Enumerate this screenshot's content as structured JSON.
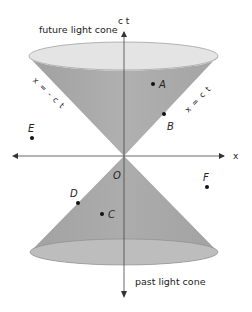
{
  "diagram": {
    "labels": {
      "future_cone": "future light cone",
      "past_cone": "past light cone",
      "time_axis": "c t",
      "space_axis": "x",
      "origin": "O",
      "line_right": "x = c t",
      "line_left": "x = - c t"
    },
    "points": [
      {
        "id": "A",
        "label": "A",
        "x": 153,
        "y": 84,
        "region": "inside future light cone"
      },
      {
        "id": "B",
        "label": "B",
        "x": 164,
        "y": 114,
        "region": "on future light cone"
      },
      {
        "id": "C",
        "label": "C",
        "x": 102,
        "y": 214,
        "region": "inside past light cone"
      },
      {
        "id": "D",
        "label": "D",
        "x": 78,
        "y": 203,
        "region": "on past light cone"
      },
      {
        "id": "E",
        "label": "E",
        "x": 32,
        "y": 138,
        "region": "elsewhere"
      },
      {
        "id": "F",
        "label": "F",
        "x": 207,
        "y": 187,
        "region": "elsewhere"
      }
    ],
    "colors": {
      "cone_fill": "#a6a6a6",
      "cone_rim": "#e6e6e6",
      "cone_bottom_rim": "#b8b8b8",
      "axis": "#333333",
      "text": "#222222"
    }
  }
}
